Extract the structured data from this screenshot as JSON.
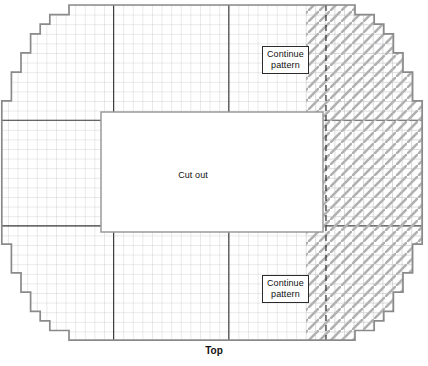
{
  "figure": {
    "type": "pattern-schematic",
    "caption": "Top",
    "caption_sub": "",
    "cutout_label": "Cut out",
    "continue_pattern_label_top": "Continue\npattern",
    "continue_pattern_label_bottom": "Continue\npattern",
    "colors": {
      "outline": "#8a8a8a",
      "minor_grid": "#c3c3c8",
      "major_grid": "#3a3a3a",
      "hatch": "#b5b5b5",
      "dashed_divider": "#1e1e1e",
      "cutout_fill": "#ffffff",
      "cutout_border": "#9a9a9a",
      "text": "#111111",
      "background": "#ffffff"
    },
    "grid": {
      "cell_px": 9.6,
      "origin_x": 8,
      "origin_y": 5,
      "cols": 43,
      "rows": 35,
      "major_every_cols": [
        11,
        27
      ],
      "major_every_rows": [
        12,
        23
      ]
    },
    "cutout": {
      "x": 101,
      "y": 112,
      "width": 222,
      "height": 120
    },
    "hatched_band": {
      "x": 306,
      "y": 5,
      "width": 106,
      "height": 335
    },
    "dashed_line_x": 326,
    "outline_steps": [
      1,
      1,
      1,
      2,
      2,
      3
    ]
  }
}
